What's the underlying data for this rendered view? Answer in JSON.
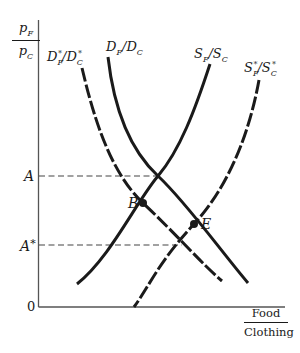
{
  "diagram": {
    "type": "supply-demand",
    "y_axis": {
      "numerator": "p",
      "numerator_sub": "F",
      "denominator": "p",
      "denominator_sub": "C"
    },
    "x_axis": {
      "numerator": "Food",
      "denominator": "Clothing"
    },
    "origin_label": "0",
    "price_levels": [
      {
        "label": "A",
        "star": ""
      },
      {
        "label": "A",
        "star": "*"
      }
    ],
    "points": [
      {
        "label": "B"
      },
      {
        "label": "E"
      }
    ],
    "curves": {
      "foreign_demand": {
        "base1": "D",
        "sub1": "F",
        "sup1": "*",
        "base2": "D",
        "sub2": "C",
        "sup2": "*",
        "style": "dashed"
      },
      "home_demand": {
        "base1": "D",
        "sub1": "F",
        "base2": "D",
        "sub2": "C",
        "style": "solid"
      },
      "home_supply": {
        "base1": "S",
        "sub1": "F",
        "base2": "S",
        "sub2": "C",
        "style": "solid"
      },
      "foreign_supply": {
        "base1": "S",
        "sub1": "F",
        "sup1": "*",
        "base2": "S",
        "sub2": "C",
        "sup2": "*",
        "style": "dashed"
      }
    },
    "colors": {
      "ink": "#1a1a1a",
      "axis": "#555555",
      "guide": "#444444"
    }
  }
}
